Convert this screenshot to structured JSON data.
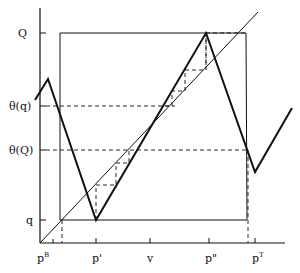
{
  "diagram": {
    "y_labels": {
      "Q": "Q",
      "theta_q": "θ(q)",
      "theta_Q": "θ(Q)",
      "q": "q"
    },
    "x_labels": {
      "pB_base": "p",
      "pB_sup": "B",
      "p_prime": "p'",
      "v": "v",
      "p_double_prime": "p\"",
      "pT_base": "p",
      "pT_sup": "T"
    },
    "colors": {
      "ink": "#111111",
      "background": "#ffffff"
    }
  }
}
